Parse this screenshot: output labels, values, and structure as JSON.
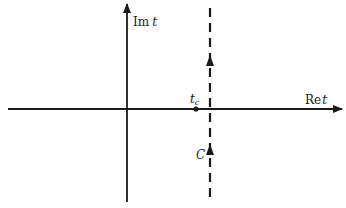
{
  "diagram": {
    "type": "complex-plane-contour",
    "colors": {
      "ink": "#1a1a1a",
      "background": "#ffffff"
    },
    "axes": {
      "real": {
        "label_prefix": "Re",
        "label_var": "t"
      },
      "imag": {
        "label_prefix": "Im",
        "label_var": "t"
      }
    },
    "point": {
      "label_var": "t",
      "label_sub": "c"
    },
    "contour": {
      "label": "C",
      "style": "dashed-vertical",
      "direction": "upward"
    }
  }
}
